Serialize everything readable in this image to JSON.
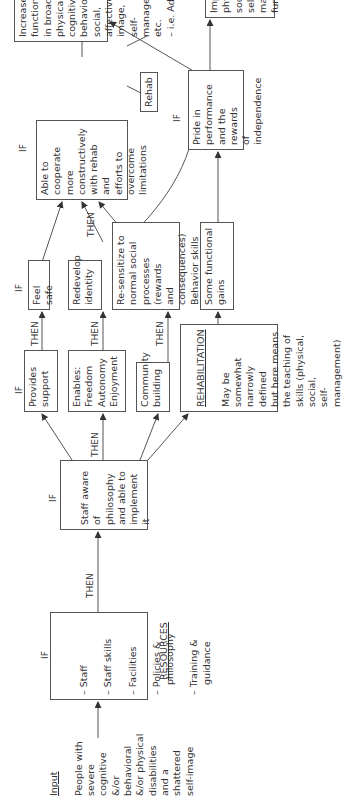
{
  "diagram": {
    "orientation": "rotated 90 degrees counterclockwise",
    "input": {
      "heading": "Input",
      "text": "People with\nsevere\ncognitive\n&/or\nbehavioral\n&/or physical\ndisabilities\nand a\nshattered\nself-image"
    },
    "resources": {
      "if_label": "IF",
      "items": [
        "Staff",
        "Staff skills",
        "Facilities",
        "Policies & philosophy",
        "Training & guidance"
      ],
      "caption": "RESOURCES"
    },
    "then_label": "THEN",
    "if_label": "IF",
    "staff_aware": {
      "if_label": "IF",
      "text": "Staff aware\nof philosophy\nand able to\nimplement it"
    },
    "provides_support": {
      "if_label": "IF",
      "text": "Provides\nsupport"
    },
    "enables": {
      "text": "Enables:\nFreedom\nAutonomy\nEnjoyment"
    },
    "community": {
      "text": "Community\nbuilding"
    },
    "rehabilitation": {
      "heading": "REHABILITATION",
      "text": "May be somewhat\nnarrowly defined\nbut here means\nthe teaching of\nskills (physical,\nsocial,\nself-management)"
    },
    "feel_safe": {
      "if_label": "IF",
      "text": "Feel safe"
    },
    "redevelop": {
      "text": "Redevelop\nidentity"
    },
    "resensitize": {
      "text": "Re-sensitize to\nnormal social\nprocesses (rewards\nand consequences)\nBehavior skills"
    },
    "functional_gains": {
      "text": "Some functional\ngains"
    },
    "cooperate": {
      "if_label": "IF",
      "text": "Able to\ncooperate more\nconstructively\nwith rehab and\nefforts to\novercome\nlimitations"
    },
    "pride": {
      "if_label": "IF",
      "text": "Pride in\nperformance\nand the rewards\nof independence"
    },
    "rehab_small": {
      "text": "Rehab"
    },
    "increased_function": {
      "text": "Increased function\nin broad areas:\nphysical, cognitive,\nbehavioral, social,\naffective, self-image,\nself-management etc.\n– i.e. Adaption"
    },
    "improved": {
      "text": "Improved\nphysical,\nsocial and self-\nmanagement\nfunction"
    }
  }
}
